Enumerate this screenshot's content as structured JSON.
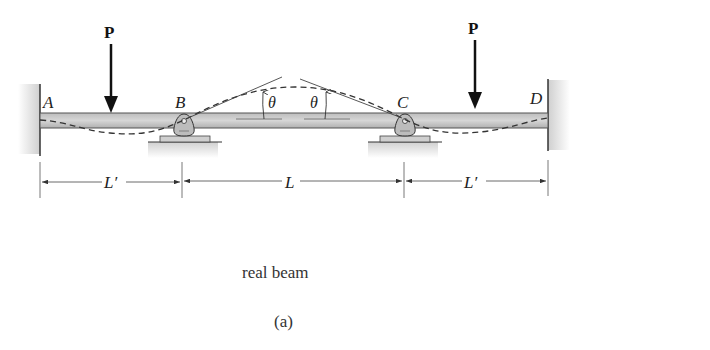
{
  "diagram": {
    "title": "real beam",
    "subfigure": "(a)",
    "loads": [
      {
        "label": "P",
        "position": "span AB"
      },
      {
        "label": "P",
        "position": "span CD"
      }
    ],
    "points": [
      {
        "label": "A",
        "type": "fixed support (left wall)"
      },
      {
        "label": "B",
        "type": "rocker/pin support"
      },
      {
        "label": "C",
        "type": "rocker/pin support"
      },
      {
        "label": "D",
        "type": "fixed support (right wall)"
      }
    ],
    "angles": [
      {
        "label": "θ"
      },
      {
        "label": "θ"
      }
    ],
    "dimensions": [
      {
        "label": "L′",
        "span": "A-B"
      },
      {
        "label": "L",
        "span": "B-C"
      },
      {
        "label": "L′",
        "span": "C-D"
      }
    ],
    "colors": {
      "beam_fill": "#c8c8c8",
      "beam_edge": "#555555",
      "wall_shade": "#d9d9d9",
      "ink": "#222222"
    }
  }
}
